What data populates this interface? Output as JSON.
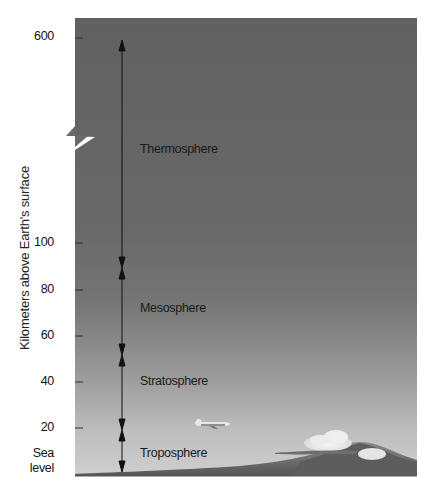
{
  "diagram": {
    "type": "atmosphere-layers",
    "y_axis": {
      "label": "Kilometers above Earth's surface",
      "ticks": [
        {
          "label": "600",
          "y": 37
        },
        {
          "label": "100",
          "y": 243
        },
        {
          "label": "80",
          "y": 290
        },
        {
          "label": "60",
          "y": 336
        },
        {
          "label": "40",
          "y": 382
        },
        {
          "label": "20",
          "y": 428
        },
        {
          "label": "Sea",
          "label2": "level",
          "y": 476
        }
      ],
      "axis_break_between": [
        "600",
        "100"
      ]
    },
    "layers": [
      {
        "name": "Thermosphere",
        "from_km": "~90",
        "to_km": "600",
        "label_y": 149
      },
      {
        "name": "Mesosphere",
        "from_km": "~50",
        "to_km": "~90",
        "label_y": 308
      },
      {
        "name": "Stratosphere",
        "from_km": "~16",
        "to_km": "~50",
        "label_y": 382
      },
      {
        "name": "Troposphere",
        "from_km": "0",
        "to_km": "~16",
        "label_y": 453
      }
    ],
    "boundaries_y": [
      40,
      268,
      355,
      430,
      470
    ],
    "illustrations": [
      "airplane-icon",
      "cloud-icon",
      "mountain-icon"
    ],
    "colors": {
      "sky_top": "#5f5f5f",
      "sky_mid": "#7a7a7a",
      "sky_bottom": "#c6c6c6",
      "ground": "#6a6a6a",
      "arrow": "#111111",
      "tick": "#333333"
    }
  }
}
